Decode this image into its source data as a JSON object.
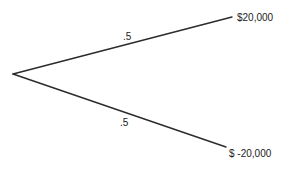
{
  "diagram": {
    "type": "decision-tree",
    "root": {
      "x": 13,
      "y": 74
    },
    "branches": [
      {
        "id": "upper",
        "end": {
          "x": 232,
          "y": 17
        },
        "probability_label": ".5",
        "probability_pos": {
          "x": 123,
          "y": 40
        },
        "outcome_label": "$20,000",
        "outcome_pos": {
          "x": 237,
          "y": 21
        }
      },
      {
        "id": "lower",
        "end": {
          "x": 226,
          "y": 147
        },
        "probability_label": ".5",
        "probability_pos": {
          "x": 120,
          "y": 126
        },
        "outcome_label": "$ -20,000",
        "outcome_pos": {
          "x": 229,
          "y": 157
        }
      }
    ],
    "line_color": "#2b2b2b",
    "text_color": "#222222"
  }
}
